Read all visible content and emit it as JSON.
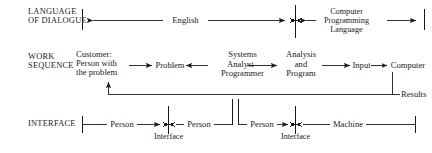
{
  "figure": {
    "title": "",
    "rows": [
      {
        "id": "language-of-dialogue",
        "heading_line1": "LANGUAGE",
        "heading_line2": "OF DIALOGUE",
        "spans": [
          {
            "id": "english",
            "label": "English"
          },
          {
            "id": "computer-programming-language",
            "label_line1": "Computer",
            "label_line2": "Programming",
            "label_line3": "Language"
          }
        ]
      },
      {
        "id": "work-sequence",
        "heading_line1": "WORK",
        "heading_line2": "SEQUENCE",
        "nodes": [
          {
            "id": "customer",
            "line1": "Customer:",
            "line2": "Person with",
            "line3": "the problem"
          },
          {
            "id": "problem",
            "line1": "Problem"
          },
          {
            "id": "systems-analyst-programmer",
            "line1": "Systems",
            "line2": "Analyst–",
            "line3": "Programmer"
          },
          {
            "id": "analysis-and-program",
            "line1": "Analysis",
            "line2": "and",
            "line3": "Program"
          },
          {
            "id": "input",
            "line1": "Input"
          },
          {
            "id": "computer",
            "line1": "Computer"
          }
        ],
        "feedback_label": "Results"
      },
      {
        "id": "interface",
        "heading_line1": "INTERFACE",
        "segments": [
          {
            "id": "person-left",
            "label": "Person"
          },
          {
            "id": "person-right",
            "label": "Person"
          },
          {
            "id": "person-second",
            "label": "Person"
          },
          {
            "id": "machine",
            "label": "Machine"
          }
        ],
        "interface_labels": [
          {
            "id": "person-person-interface",
            "label": "Interface"
          },
          {
            "id": "person-machine-interface",
            "label": "Interface"
          }
        ]
      }
    ]
  },
  "colors": {
    "ink": "#1a1a1a",
    "background": "#ffffff"
  }
}
